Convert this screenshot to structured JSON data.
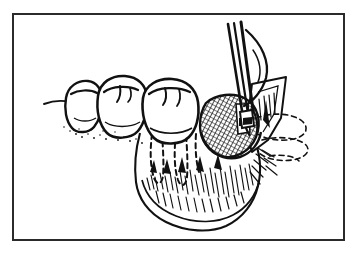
{
  "figure": {
    "kind": "line-art-medical-illustration",
    "background_color": "#ffffff",
    "ink_color": "#111111",
    "frame_color": "#2b2b2b",
    "frame": {
      "x": 12,
      "y": 13,
      "width": 333,
      "height": 228,
      "border_width": 2
    },
    "canvas": {
      "width": 358,
      "height": 257
    },
    "labels": [],
    "annotation_text": "",
    "structures": [
      {
        "name": "first-molar-crown",
        "label": ""
      },
      {
        "name": "second-molar-crown",
        "label": ""
      },
      {
        "name": "third-molar-crown",
        "label": ""
      },
      {
        "name": "molar-roots-dashed",
        "label": ""
      },
      {
        "name": "crosshatched-bone-window",
        "label": ""
      },
      {
        "name": "mucoperiosteal-flap",
        "label": ""
      },
      {
        "name": "ramus-dashed-outline",
        "label": ""
      },
      {
        "name": "mandible-body-hatching",
        "label": ""
      },
      {
        "name": "surgical-elevator-instrument",
        "label": ""
      },
      {
        "name": "retractor-tip",
        "label": ""
      },
      {
        "name": "gingival-margin-line",
        "label": ""
      }
    ]
  }
}
